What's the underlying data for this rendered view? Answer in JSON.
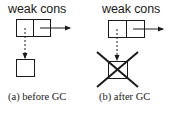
{
  "figure": {
    "panels": [
      {
        "id": "a",
        "title": "weak cons",
        "caption": "(a) before GC",
        "target_collected": false
      },
      {
        "id": "b",
        "title": "weak cons",
        "caption": "(b) after GC",
        "target_collected": true
      }
    ],
    "colors": {
      "stroke": "#1a1a1a",
      "background": "#ffffff"
    }
  }
}
